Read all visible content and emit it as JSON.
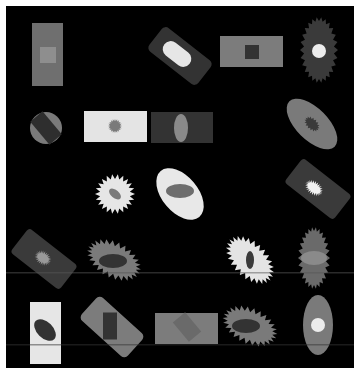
{
  "image": {
    "width": 362,
    "height": 368,
    "description": "Synthetic grayscale image of geometric shapes (rectangles, rounded rectangles, ellipses, starbursts, circles) nested inside each other on a black background with a thin white border",
    "border_color": "#ffffff",
    "background_color": "#000000",
    "canvas": {
      "x": 6,
      "y": 6,
      "width": 348,
      "height": 362
    }
  },
  "colors": {
    "black": "#000000",
    "dark": "#3a3a3a",
    "darker": "#2e2e2e",
    "mid_dark": "#4a4a4a",
    "mid": "#7a7a7a",
    "mid_light": "#8c8c8c",
    "light": "#e2e2e2",
    "white": "#f0f0f0"
  },
  "shapes": [
    {
      "id": "s1",
      "kind": "rect",
      "x": 32,
      "y": 23,
      "w": 31,
      "h": 63,
      "fill": "#6f6f6f",
      "inner": {
        "kind": "rect",
        "x": 40,
        "y": 47,
        "w": 16,
        "h": 16,
        "fill": "#8e8e8e"
      }
    },
    {
      "id": "s2",
      "kind": "rounded-rect",
      "cx": 180,
      "cy": 56,
      "w": 62,
      "h": 30,
      "rot": 38,
      "rx": 5,
      "fill": "#333333",
      "inner": {
        "kind": "rounded-rect",
        "cx": 177,
        "cy": 54,
        "w": 32,
        "h": 16,
        "rot": 38,
        "rx": 8,
        "fill": "#e6e6e6"
      }
    },
    {
      "id": "s3",
      "kind": "rect",
      "x": 220,
      "y": 36,
      "w": 63,
      "h": 31,
      "fill": "#7c7c7c",
      "inner": {
        "kind": "rect",
        "x": 245,
        "y": 45,
        "w": 14,
        "h": 14,
        "fill": "#333333"
      }
    },
    {
      "id": "s4",
      "kind": "starburst",
      "cx": 319,
      "cy": 50,
      "rx": 15,
      "ry": 29,
      "rot": 0,
      "spikes": 26,
      "spike": 4,
      "fill": "#3a3a3a",
      "inner": {
        "kind": "circle",
        "cx": 319,
        "cy": 51,
        "r": 7,
        "fill": "#ececec"
      }
    },
    {
      "id": "s5",
      "kind": "circle",
      "cx": 46,
      "cy": 128,
      "r": 16,
      "fill": "#7a7a7a",
      "inner": {
        "kind": "rect",
        "cx": 46,
        "cy": 128,
        "w": 16,
        "h": 30,
        "rot": -40,
        "fill": "#2e2e2e"
      }
    },
    {
      "id": "s6",
      "kind": "rect",
      "x": 84,
      "y": 111,
      "w": 63,
      "h": 31,
      "fill": "#e4e4e4",
      "inner": {
        "kind": "starburst",
        "cx": 115,
        "cy": 126,
        "rx": 5,
        "ry": 5,
        "rot": 0,
        "spikes": 20,
        "spike": 2,
        "fill": "#7a7a7a"
      }
    },
    {
      "id": "s7",
      "kind": "rect",
      "x": 151,
      "y": 112,
      "w": 62,
      "h": 31,
      "fill": "#333333",
      "inner": {
        "kind": "ellipse",
        "cx": 181,
        "cy": 128,
        "rx": 7,
        "ry": 14,
        "rot": 0,
        "fill": "#8a8a8a"
      }
    },
    {
      "id": "s8",
      "kind": "ellipse",
      "cx": 312,
      "cy": 124,
      "rx": 32,
      "ry": 16,
      "rot": 45,
      "fill": "#7a7a7a",
      "inner": {
        "kind": "starburst",
        "cx": 312,
        "cy": 124,
        "rx": 7,
        "ry": 4,
        "rot": 45,
        "spikes": 16,
        "spike": 2,
        "fill": "#3a3a3a"
      }
    },
    {
      "id": "s9",
      "kind": "starburst",
      "cx": 115,
      "cy": 194,
      "rx": 15,
      "ry": 15,
      "rot": 0,
      "spikes": 22,
      "spike": 5,
      "fill": "#e6e6e6",
      "inner": {
        "kind": "ellipse",
        "cx": 115,
        "cy": 194,
        "rx": 7,
        "ry": 4,
        "rot": 40,
        "fill": "#7a7a7a"
      }
    },
    {
      "id": "s10",
      "kind": "ellipse",
      "cx": 180,
      "cy": 194,
      "rx": 30,
      "ry": 18,
      "rot": 50,
      "fill": "#e8e8e8",
      "inner": {
        "kind": "ellipse",
        "cx": 180,
        "cy": 191,
        "rx": 14,
        "ry": 7,
        "rot": 0,
        "fill": "#6e6e6e"
      }
    },
    {
      "id": "s11",
      "kind": "rounded-rect",
      "cx": 318,
      "cy": 189,
      "w": 62,
      "h": 31,
      "rot": 38,
      "rx": 4,
      "fill": "#3a3a3a",
      "inner": {
        "kind": "starburst",
        "cx": 314,
        "cy": 188,
        "rx": 7,
        "ry": 4,
        "rot": 38,
        "spikes": 24,
        "spike": 3,
        "fill": "#f2f2f2"
      }
    },
    {
      "id": "s12",
      "kind": "rounded-rect",
      "cx": 44,
      "cy": 259,
      "w": 62,
      "h": 31,
      "rot": 38,
      "rx": 4,
      "fill": "#3a3a3a",
      "inner": {
        "kind": "starburst",
        "cx": 43,
        "cy": 258,
        "rx": 6,
        "ry": 4,
        "rot": 38,
        "spikes": 24,
        "spike": 3,
        "fill": "#999999"
      }
    },
    {
      "id": "s13",
      "kind": "starburst",
      "cx": 114,
      "cy": 260,
      "rx": 24,
      "ry": 13,
      "rot": 28,
      "spikes": 26,
      "spike": 5,
      "fill": "#7a7a7a",
      "inner": {
        "kind": "ellipse",
        "cx": 113,
        "cy": 261,
        "rx": 14,
        "ry": 7,
        "rot": 0,
        "fill": "#333333"
      }
    },
    {
      "id": "s14",
      "kind": "starburst",
      "cx": 250,
      "cy": 260,
      "rx": 24,
      "ry": 13,
      "rot": 45,
      "spikes": 26,
      "spike": 5,
      "fill": "#e4e4e4",
      "inner": {
        "kind": "ellipse",
        "cx": 250,
        "cy": 260,
        "rx": 4,
        "ry": 9,
        "rot": 0,
        "fill": "#3a3a3a"
      }
    },
    {
      "id": "s15",
      "kind": "starburst",
      "cx": 314,
      "cy": 258,
      "rx": 12,
      "ry": 27,
      "rot": 0,
      "spikes": 26,
      "spike": 4,
      "fill": "#6a6a6a",
      "inner": {
        "kind": "ellipse",
        "cx": 314,
        "cy": 258,
        "rx": 13,
        "ry": 7,
        "rot": 0,
        "fill": "#8a8a8a"
      }
    },
    {
      "id": "s16",
      "kind": "rect",
      "x": 30,
      "y": 302,
      "w": 31,
      "h": 62,
      "fill": "#e6e6e6",
      "inner": {
        "kind": "ellipse",
        "cx": 45,
        "cy": 330,
        "rx": 13,
        "ry": 8,
        "rot": 45,
        "fill": "#333333"
      }
    },
    {
      "id": "s17",
      "kind": "rounded-rect",
      "cx": 112,
      "cy": 327,
      "w": 62,
      "h": 31,
      "rot": 42,
      "rx": 5,
      "fill": "#7c7c7c",
      "inner": {
        "kind": "rect",
        "cx": 110,
        "cy": 326,
        "w": 14,
        "h": 27,
        "rot": 0,
        "fill": "#333333"
      }
    },
    {
      "id": "s18",
      "kind": "rect",
      "x": 155,
      "y": 313,
      "w": 63,
      "h": 31,
      "fill": "#7c7c7c",
      "inner": {
        "kind": "rect",
        "cx": 187,
        "cy": 327,
        "w": 16,
        "h": 25,
        "rot": -40,
        "fill": "#6a6a6a"
      }
    },
    {
      "id": "s19",
      "kind": "starburst",
      "cx": 250,
      "cy": 326,
      "rx": 24,
      "ry": 13,
      "rot": 25,
      "spikes": 26,
      "spike": 5,
      "fill": "#7a7a7a",
      "inner": {
        "kind": "ellipse",
        "cx": 246,
        "cy": 326,
        "rx": 14,
        "ry": 7,
        "rot": 0,
        "fill": "#333333"
      }
    },
    {
      "id": "s20",
      "kind": "ellipse",
      "cx": 318,
      "cy": 325,
      "rx": 15,
      "ry": 30,
      "rot": 0,
      "fill": "#7a7a7a",
      "inner": {
        "kind": "circle",
        "cx": 318,
        "cy": 325,
        "r": 7,
        "fill": "#ececec"
      }
    }
  ],
  "artifacts": [
    {
      "kind": "scanline",
      "y": 272,
      "x": 6,
      "w": 348,
      "color": "#555555"
    },
    {
      "kind": "scanline",
      "y": 344,
      "x": 6,
      "w": 348,
      "color": "#333333"
    }
  ]
}
